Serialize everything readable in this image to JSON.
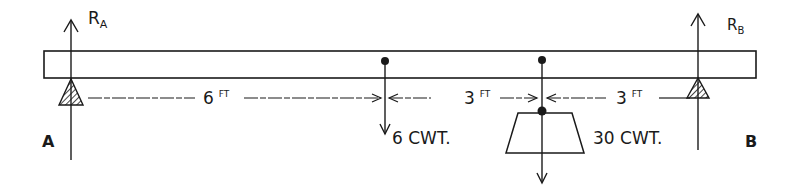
{
  "diagram": {
    "type": "simply-supported-beam",
    "colors": {
      "ink": "#1a1a1a",
      "background": "#ffffff"
    },
    "supports": [
      {
        "id": "A",
        "label": "A",
        "reaction_label": "R",
        "reaction_sub": "A"
      },
      {
        "id": "B",
        "label": "B",
        "reaction_label": "R",
        "reaction_sub": "B"
      }
    ],
    "loads": [
      {
        "id": "load-1",
        "value": "6",
        "unit": "CWT.",
        "label": "6 CWT."
      },
      {
        "id": "load-2",
        "value": "30",
        "unit": "CWT.",
        "label": "30 CWT."
      }
    ],
    "dimensions": [
      {
        "from": "A",
        "to": "load-1",
        "value": "6",
        "unit": "FT"
      },
      {
        "from": "load-1",
        "to": "load-2",
        "value": "3",
        "unit": "FT"
      },
      {
        "from": "load-2",
        "to": "B",
        "value": "3",
        "unit": "FT"
      }
    ]
  }
}
